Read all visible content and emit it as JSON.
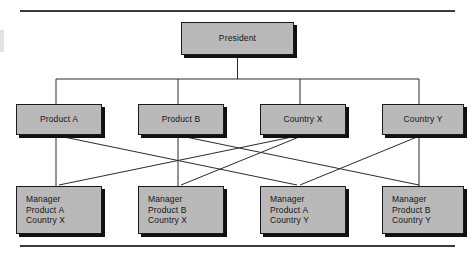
{
  "figure": {
    "type": "matrix-organization-chart",
    "background_color": "#ffffff",
    "box_fill_color": "#b9b9b9",
    "box_border_color": "#1a1a1a",
    "shadow_color": "#111111",
    "line_color": "#2b2b2b",
    "rule_color": "#3b3b3b"
  },
  "nodes": {
    "president": {
      "label": "President"
    },
    "product_a": {
      "label": "Product A"
    },
    "product_b": {
      "label": "Product B"
    },
    "country_x": {
      "label": "Country X"
    },
    "country_y": {
      "label": "Country Y"
    },
    "manager_1": {
      "label": "Manager\nProduct A\nCountry X"
    },
    "manager_2": {
      "label": "Manager\nProduct B\nCountry X"
    },
    "manager_3": {
      "label": "Manager\nProduct A\nCountry Y"
    },
    "manager_4": {
      "label": "Manager\nProduct B\nCountry Y"
    }
  },
  "edges": [
    {
      "from": "president",
      "to": "product_a",
      "style": "orthogonal"
    },
    {
      "from": "president",
      "to": "product_b",
      "style": "orthogonal"
    },
    {
      "from": "president",
      "to": "country_x",
      "style": "orthogonal"
    },
    {
      "from": "president",
      "to": "country_y",
      "style": "orthogonal"
    },
    {
      "from": "product_a",
      "to": "manager_1",
      "style": "straight"
    },
    {
      "from": "product_a",
      "to": "manager_3",
      "style": "straight"
    },
    {
      "from": "product_b",
      "to": "manager_2",
      "style": "straight"
    },
    {
      "from": "product_b",
      "to": "manager_4",
      "style": "straight"
    },
    {
      "from": "country_x",
      "to": "manager_1",
      "style": "straight"
    },
    {
      "from": "country_x",
      "to": "manager_2",
      "style": "straight"
    },
    {
      "from": "country_y",
      "to": "manager_3",
      "style": "straight"
    },
    {
      "from": "country_y",
      "to": "manager_4",
      "style": "straight"
    }
  ]
}
